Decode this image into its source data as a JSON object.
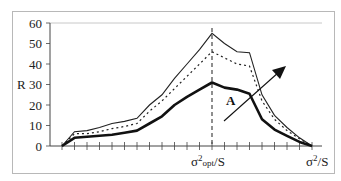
{
  "chart_data": {
    "type": "line",
    "title": "",
    "ylabel": "R",
    "xlabel": "σ²/S",
    "ylim": [
      0,
      60
    ],
    "yticks": [
      0,
      10,
      20,
      30,
      40,
      50,
      60
    ],
    "x_tick_count": 20,
    "x_labels": [
      {
        "position": 12,
        "label_main": "σ",
        "label_sup": "2",
        "label_sub": "opt",
        "label_tail": "/S"
      },
      {
        "position": 20,
        "label_main": "σ",
        "label_sup": "2",
        "label_sub": "",
        "label_tail": "/S"
      }
    ],
    "x": [
      0,
      1,
      2,
      3,
      4,
      5,
      6,
      7,
      8,
      9,
      10,
      11,
      12,
      13,
      14,
      15,
      16,
      17,
      18,
      19,
      20
    ],
    "series": [
      {
        "name": "upper (thin solid)",
        "style": "solid-thin",
        "values": [
          0,
          7,
          7.5,
          9,
          11,
          12,
          13.5,
          20,
          25,
          33,
          40,
          47,
          55,
          50,
          46,
          45.5,
          25,
          15,
          9,
          4,
          0
        ]
      },
      {
        "name": "middle (dotted)",
        "style": "dotted",
        "values": [
          0,
          6,
          6,
          7,
          8.5,
          9.5,
          11,
          17,
          22,
          28,
          34,
          40,
          46,
          43,
          40,
          39,
          22,
          13,
          7.5,
          3.5,
          0
        ]
      },
      {
        "name": "lower (bold solid)",
        "style": "solid-bold",
        "values": [
          0,
          4,
          4.5,
          5,
          5.5,
          6.5,
          7.5,
          11,
          14.5,
          20,
          24,
          27.5,
          31,
          28.5,
          27.5,
          25.5,
          13,
          8,
          5,
          2,
          0
        ]
      }
    ],
    "optimum_marker": {
      "position": 12,
      "style": "vertical dashed line",
      "label": "σ²opt/S"
    },
    "annotations": [
      {
        "text": "A",
        "type": "arrow",
        "direction": "up-right",
        "meaning": "increasing trend across curves"
      }
    ],
    "grid": false,
    "legend": "none"
  },
  "labels": {
    "y_axis": "R",
    "y_ticks": [
      "0",
      "10",
      "20",
      "30",
      "40",
      "50",
      "60"
    ],
    "x_opt_main": "σ",
    "x_opt_sup": "2",
    "x_opt_sub": "opt",
    "x_opt_tail": "/S",
    "x_end_main": "σ",
    "x_end_sup": "2",
    "x_end_tail": "/S",
    "annotation_A": "A"
  }
}
